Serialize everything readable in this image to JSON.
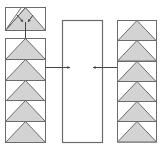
{
  "diagram": {
    "colors": {
      "stroke": "#6b6b6b",
      "fill": "#d3d3d3",
      "arrow": "#444444",
      "background": "#ffffff"
    },
    "left_stack": {
      "top_cell": {
        "x": 5,
        "y": 7,
        "w": 40,
        "h": 23,
        "type": "split-triangle-with-inward-arrows"
      },
      "cells": [
        {
          "y": 38
        },
        {
          "y": 59
        },
        {
          "y": 80
        },
        {
          "y": 100
        },
        {
          "y": 121
        }
      ],
      "x": 5,
      "w": 40,
      "cell_h": 21
    },
    "right_stack": {
      "cells": [
        {
          "y": 20
        },
        {
          "y": 40
        },
        {
          "y": 61
        },
        {
          "y": 81
        },
        {
          "y": 101
        },
        {
          "y": 121
        }
      ],
      "x": 117,
      "w": 39,
      "cell_h": 20.5
    },
    "center_box": {
      "x": 62,
      "y": 20,
      "w": 40,
      "h": 122
    },
    "arrows": [
      {
        "from": [
          45,
          67
        ],
        "to": [
          70,
          67
        ],
        "label": "left-to-center"
      },
      {
        "from": [
          117,
          67
        ],
        "to": [
          93,
          67
        ],
        "label": "right-to-center"
      }
    ],
    "connector": {
      "from": [
        25,
        22
      ],
      "to": [
        25,
        50
      ]
    }
  }
}
